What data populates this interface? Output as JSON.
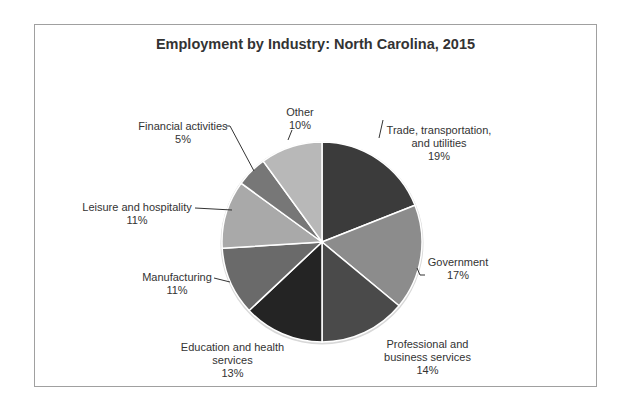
{
  "chart_data": {
    "type": "pie",
    "title": "Employment by Industry: North Carolina, 2015",
    "slices": [
      {
        "label": "Trade, transportation, and utilities",
        "value": 19,
        "display": "19%",
        "color": "#3b3b3b"
      },
      {
        "label": "Government",
        "value": 17,
        "display": "17%",
        "color": "#8c8c8c"
      },
      {
        "label": "Professional and business services",
        "value": 14,
        "display": "14%",
        "color": "#4a4a4a"
      },
      {
        "label": "Education and health services",
        "value": 13,
        "display": "13%",
        "color": "#242424"
      },
      {
        "label": "Manufacturing",
        "value": 11,
        "display": "11%",
        "color": "#6a6a6a"
      },
      {
        "label": "Leisure and hospitality",
        "value": 11,
        "display": "11%",
        "color": "#a9a9a9"
      },
      {
        "label": "Financial activities",
        "value": 5,
        "display": "5%",
        "color": "#777777"
      },
      {
        "label": "Other",
        "value": 10,
        "display": "10%",
        "color": "#b8b8b8"
      }
    ],
    "legend": "none (data labels with leader lines)",
    "start_angle": "12 o'clock, clockwise"
  },
  "labels": {
    "trade_l1": "Trade, transportation,",
    "trade_l2": "and utilities",
    "trade_pct": "19%",
    "gov_l1": "Government",
    "gov_pct": "17%",
    "prof_l1": "Professional and",
    "prof_l2": "business services",
    "prof_pct": "14%",
    "edu_l1": "Education and health",
    "edu_l2": "services",
    "edu_pct": "13%",
    "mfg_l1": "Manufacturing",
    "mfg_pct": "11%",
    "leis_l1": "Leisure and hospitality",
    "leis_pct": "11%",
    "fin_l1": "Financial activities",
    "fin_pct": "5%",
    "other_l1": "Other",
    "other_pct": "10%"
  }
}
